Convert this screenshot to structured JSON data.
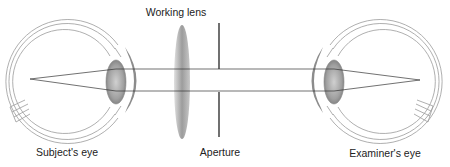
{
  "diagram": {
    "labels": {
      "working_lens": "Working lens",
      "subject_eye": "Subject's eye",
      "aperture": "Aperture",
      "examiner_eye": "Examiner's eye"
    },
    "colors": {
      "outline": "#9a9a9a",
      "ray": "#333333",
      "lens_fill": "#a8a8a8",
      "cornea": "#8c8c8c",
      "aperture": "#111111"
    }
  }
}
